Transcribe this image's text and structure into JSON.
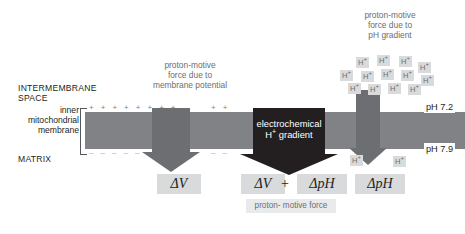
{
  "diagram": {
    "regions": {
      "intermembrane_space": "INTERMEMBRANE\nSPACE",
      "matrix": "MATRIX",
      "membrane_label": "inner\nmitochondrial\nmembrane"
    },
    "captions": {
      "membrane_potential": "proton-motive\nforce due to\nmembrane potential",
      "ph_gradient": "proton-motive\nforce due to\npH gradient"
    },
    "center_arrow_label": "electrochemical\nH+ gradient",
    "ph_top": "pH 7.2",
    "ph_bottom": "pH 7.9",
    "charges": {
      "top_left": "+ + + + + + + +",
      "bottom_left": "_ _ _ _ _ _ _ _",
      "top_mid": "+ +",
      "bottom_mid": "_ _"
    },
    "formulas": {
      "delta_v": "ΔV",
      "delta_v_2": "ΔV",
      "plus": "+",
      "delta_ph": "ΔpH",
      "delta_ph_2": "ΔpH",
      "pmf_caption": "proton-\nmotive force"
    },
    "ion_label": "H",
    "ion_charge": "+",
    "ions_top": [
      {
        "x": 356,
        "y": 57
      },
      {
        "x": 377,
        "y": 55
      },
      {
        "x": 399,
        "y": 56
      },
      {
        "x": 418,
        "y": 62
      },
      {
        "x": 340,
        "y": 70
      },
      {
        "x": 361,
        "y": 71
      },
      {
        "x": 381,
        "y": 69
      },
      {
        "x": 401,
        "y": 70
      },
      {
        "x": 421,
        "y": 75
      },
      {
        "x": 348,
        "y": 83
      },
      {
        "x": 368,
        "y": 84
      },
      {
        "x": 388,
        "y": 83
      },
      {
        "x": 408,
        "y": 84
      }
    ],
    "ions_bottom": [
      {
        "x": 350,
        "y": 155
      },
      {
        "x": 393,
        "y": 156
      }
    ],
    "colors": {
      "membrane": "#808285",
      "gray_arrow": "#6d6e71",
      "dark_arrow": "#231f20",
      "caption_text": "#6d6e71",
      "chip_bg": "#d9dadb",
      "text": "#231f20"
    }
  }
}
